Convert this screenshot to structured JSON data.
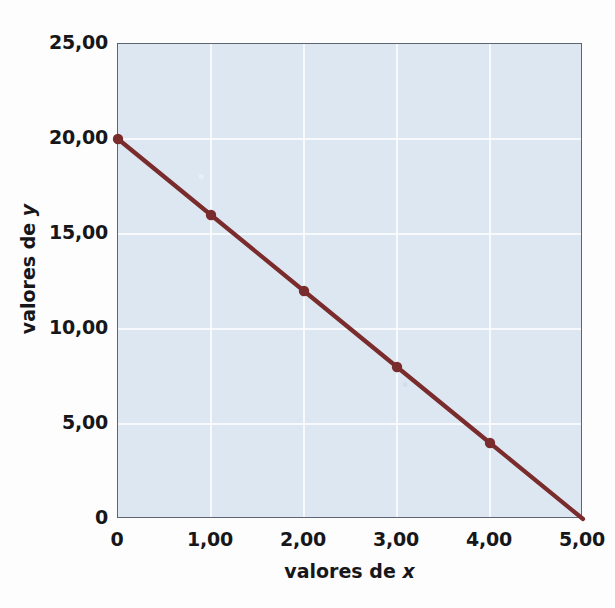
{
  "chart_data": {
    "type": "line",
    "title": "",
    "subtitle": "",
    "xlabel_prefix": "valores de ",
    "xlabel_var": "x",
    "ylabel_prefix": "valores de ",
    "ylabel_var": "y",
    "x": [
      0,
      1,
      2,
      3,
      4,
      5
    ],
    "series": [
      {
        "name": "y",
        "values": [
          20,
          16,
          12,
          8,
          4,
          0
        ],
        "color": "#7a2b2b",
        "marker": "circle",
        "marker_on_last_point": false
      }
    ],
    "xlim": [
      0,
      5
    ],
    "ylim": [
      0,
      25
    ],
    "xticks": [
      0,
      1,
      2,
      3,
      4,
      5
    ],
    "yticks": [
      0,
      5,
      10,
      15,
      20,
      25
    ],
    "xtick_labels": [
      "0",
      "1,00",
      "2,00",
      "3,00",
      "4,00",
      "5,00"
    ],
    "ytick_labels": [
      "0",
      "5,00",
      "10,00",
      "15,00",
      "20,00",
      "25,00"
    ],
    "grid": true,
    "grid_color": "#ffffff",
    "legend": false,
    "legend_position": "none",
    "plot_background": "#dde7f2",
    "frame_color": "#5d6472",
    "decimal_separator": ","
  },
  "bleed_through_text": [
    "s os 11 nm = 1 x 10   m, ou em piedra",
    "1 x 10    m. No entanto, costuma-se usar",
    "A, sendo 1 A = 1 x 10    cm. A unidade in",
    "porém, é o metro e, quando usamos a nota",
    "m decimetro para comprimentos imple:",
    "essa definição em nanometros, com o nome"
  ]
}
